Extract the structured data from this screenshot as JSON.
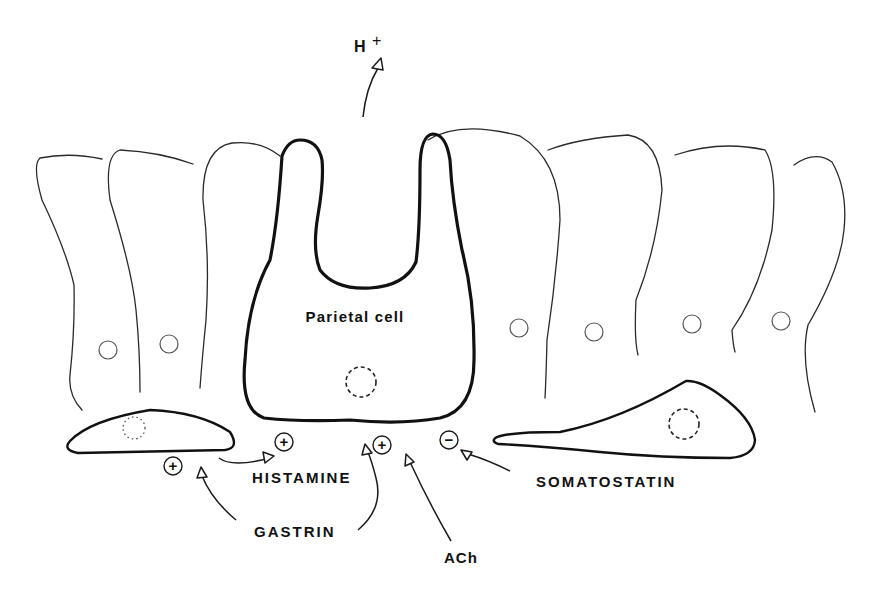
{
  "diagram": {
    "product": {
      "label": "H",
      "superscript": "+"
    },
    "cells": {
      "main": {
        "label": "Parietal cell"
      },
      "neighbors_count": 6,
      "left_endocrine": "ECL-like cell (histamine source)",
      "right_endocrine": "D-like cell (somatostatin source)"
    },
    "signals": [
      {
        "name": "HISTAMINE",
        "effect": "+",
        "color": "#111111"
      },
      {
        "name": "GASTRIN",
        "effect": "+",
        "targets": 2
      },
      {
        "name": "ACh",
        "effect": "+"
      },
      {
        "name": "SOMATOSTATIN",
        "effect": "−"
      }
    ],
    "signs": {
      "plus": "+",
      "minus": "−"
    }
  }
}
